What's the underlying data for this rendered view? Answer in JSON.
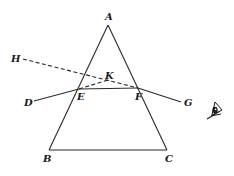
{
  "diagram": {
    "type": "optics-prism-refraction",
    "colors": {
      "stroke": "#2a2a2a",
      "text": "#1a1a1a",
      "background": "#ffffff"
    },
    "points": {
      "A": {
        "label": "A",
        "x": 108,
        "y": 25
      },
      "B": {
        "label": "B",
        "x": 49,
        "y": 150
      },
      "C": {
        "label": "C",
        "x": 167,
        "y": 150
      },
      "D": {
        "label": "D",
        "x": 34,
        "y": 101
      },
      "E": {
        "label": "E",
        "x": 79,
        "y": 89
      },
      "F": {
        "label": "F",
        "x": 138,
        "y": 88
      },
      "G": {
        "label": "G",
        "x": 181,
        "y": 102
      },
      "H": {
        "label": "H",
        "x": 23,
        "y": 59
      },
      "K": {
        "label": "K",
        "x": 108,
        "y": 80
      }
    },
    "segments": [
      {
        "from": "A",
        "to": "B",
        "style": "solid"
      },
      {
        "from": "A",
        "to": "C",
        "style": "solid"
      },
      {
        "from": "B",
        "to": "C",
        "style": "solid"
      },
      {
        "from": "D",
        "to": "E",
        "style": "solid"
      },
      {
        "from": "E",
        "to": "F",
        "style": "solid"
      },
      {
        "from": "F",
        "to": "G",
        "style": "solid"
      },
      {
        "from": "H",
        "to": "F",
        "style": "dashed"
      },
      {
        "from": "E",
        "to": "K",
        "style": "dashed"
      }
    ],
    "icons": [
      {
        "name": "eye-icon",
        "x": 215,
        "y": 112
      }
    ]
  }
}
